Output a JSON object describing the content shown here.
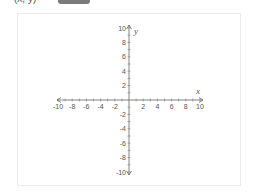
{
  "header": {
    "cut_text_left": "(x, y)",
    "badge_color": "#7a7a7a",
    "cut_text_right": "..."
  },
  "graph": {
    "type": "coordinate-plane",
    "x_axis_label": "x",
    "y_axis_label": "y",
    "x_range": [
      -10,
      10
    ],
    "y_range": [
      -10,
      10
    ],
    "x_tick_labels": [
      "-10",
      "-8",
      "-6",
      "-4",
      "-2",
      "2",
      "4",
      "6",
      "8",
      "10"
    ],
    "y_tick_labels": [
      "10",
      "8",
      "6",
      "4",
      "2",
      "-2",
      "-4",
      "-6",
      "-8",
      "-10"
    ],
    "minor_tick_step": 1,
    "label_step": 2,
    "axis_color": "#666666",
    "frame_color": "#ececec"
  }
}
